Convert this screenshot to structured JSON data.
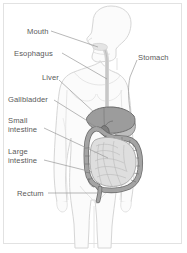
{
  "diagram": {
    "style": "grayscale line drawing",
    "colors": {
      "background": "#ffffff",
      "frame_border": "#e2e2e2",
      "body_fill": "#fbfbfb",
      "body_outline": "#d6d6d6",
      "label_text": "#5a5a5a",
      "leader_line": "#9a9a9a",
      "liver_fill": "#9c9c9c",
      "liver_outline": "#6f6f6f",
      "stomach_fill": "#bdbdbd",
      "stomach_outline": "#8a8a8a",
      "large_intestine_fill": "#a4a4a4",
      "large_intestine_outline": "#6f6f6f",
      "small_intestine_fill": "#dedede",
      "small_intestine_outline": "#9a9a9a",
      "gallbladder_fill": "#8a8a8a",
      "esophagus_fill": "#ececec"
    },
    "labels": [
      {
        "id": "mouth",
        "text": "Mouth",
        "x": 27,
        "y": 28
      },
      {
        "id": "esophagus",
        "text": "Esophagus",
        "x": 14,
        "y": 50
      },
      {
        "id": "liver",
        "text": "Liver",
        "x": 42,
        "y": 74
      },
      {
        "id": "gallbladder",
        "text": "Gallbladder",
        "x": 8,
        "y": 96
      },
      {
        "id": "small-intestine",
        "text": "Small\nintestine",
        "x": 8,
        "y": 117
      },
      {
        "id": "large-intestine",
        "text": "Large\nintestine",
        "x": 8,
        "y": 148
      },
      {
        "id": "rectum",
        "text": "Rectum",
        "x": 17,
        "y": 190
      },
      {
        "id": "stomach",
        "text": "Stomach",
        "x": 138,
        "y": 54
      }
    ],
    "organs": [
      {
        "id": "mouth",
        "name": "Mouth"
      },
      {
        "id": "esophagus",
        "name": "Esophagus"
      },
      {
        "id": "stomach",
        "name": "Stomach"
      },
      {
        "id": "liver",
        "name": "Liver"
      },
      {
        "id": "gallbladder",
        "name": "Gallbladder"
      },
      {
        "id": "small-intestine",
        "name": "Small intestine"
      },
      {
        "id": "large-intestine",
        "name": "Large intestine"
      },
      {
        "id": "rectum",
        "name": "Rectum"
      }
    ]
  }
}
